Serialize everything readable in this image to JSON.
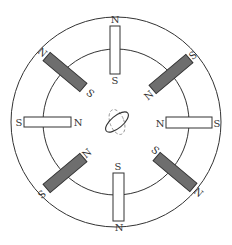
{
  "diagram": {
    "title": "",
    "colors": {
      "background": "#ffffff",
      "stroke": "#333333",
      "magnet_light": "#ffffff",
      "magnet_dark": "#6e6e6e",
      "compass": "#444444"
    },
    "outer_circle": {
      "cx": 116,
      "cy": 122,
      "r": 105
    },
    "inner_circle": {
      "cx": 116,
      "cy": 122,
      "r": 73
    },
    "center_symbol": "compass-needle-ellipse",
    "magnets": [
      {
        "id": "top",
        "color": "light",
        "outer_pole": "N",
        "inner_pole": "S"
      },
      {
        "id": "top-right",
        "color": "dark",
        "outer_pole": "S",
        "inner_pole": "N"
      },
      {
        "id": "right",
        "color": "light",
        "outer_pole": "S",
        "inner_pole": "N"
      },
      {
        "id": "bottom-right",
        "color": "dark",
        "outer_pole": "N",
        "inner_pole": "S"
      },
      {
        "id": "bottom",
        "color": "light",
        "outer_pole": "N",
        "inner_pole": "S"
      },
      {
        "id": "bottom-left",
        "color": "dark",
        "outer_pole": "S",
        "inner_pole": "N"
      },
      {
        "id": "left",
        "color": "light",
        "outer_pole": "S",
        "inner_pole": "N"
      },
      {
        "id": "top-left",
        "color": "dark",
        "outer_pole": "N",
        "inner_pole": "S"
      }
    ],
    "labels": {
      "top_outer": "N",
      "top_inner": "S",
      "topright_outer": "S",
      "topright_inner": "N",
      "right_outer": "S",
      "right_inner": "N",
      "bottomright_outer": "N",
      "bottomright_inner": "S",
      "bottom_outer": "N",
      "bottom_inner": "S",
      "bottomleft_outer": "S",
      "bottomleft_inner": "N",
      "left_outer": "S",
      "left_inner": "N",
      "topleft_outer": "N",
      "topleft_inner": "S"
    }
  }
}
